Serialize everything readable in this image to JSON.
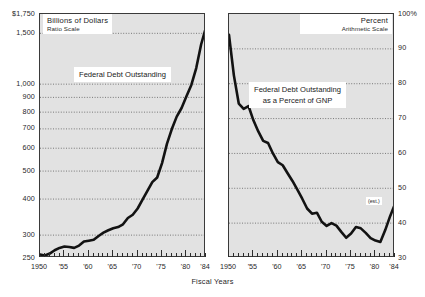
{
  "figure": {
    "axis_title": "Fiscal Years"
  },
  "chart_data": [
    {
      "id": "left",
      "type": "line",
      "title": "Federal Debt Outstanding",
      "header_line1": "Billions of Dollars",
      "header_line2": "Ratio Scale",
      "scale": "log",
      "xlabel": "Fiscal Years",
      "ylabel": "Billions of Dollars",
      "grid": true,
      "legend": "none",
      "ylim": [
        250,
        1750
      ],
      "xlim": [
        1950,
        1984
      ],
      "ytick_labels": [
        "$1,750",
        "1,500",
        "1,000",
        "900",
        "800",
        "700",
        "600",
        "500",
        "400",
        "300",
        "250"
      ],
      "ytick_values": [
        1750,
        1500,
        1000,
        900,
        800,
        700,
        600,
        500,
        400,
        300,
        250
      ],
      "gridline_values": [
        1500,
        1000,
        900,
        800,
        700,
        600,
        500,
        400,
        300
      ],
      "xtick_labels": [
        "1950",
        "'55",
        "'60",
        "'65",
        "'70",
        "'75",
        "'80",
        "'84"
      ],
      "xtick_values": [
        1950,
        1955,
        1960,
        1965,
        1970,
        1975,
        1980,
        1984
      ],
      "x": [
        1950,
        1951,
        1952,
        1953,
        1954,
        1955,
        1956,
        1957,
        1958,
        1959,
        1960,
        1961,
        1962,
        1963,
        1964,
        1965,
        1966,
        1967,
        1968,
        1969,
        1970,
        1971,
        1972,
        1973,
        1974,
        1975,
        1976,
        1977,
        1978,
        1979,
        1980,
        1981,
        1982,
        1983,
        1984
      ],
      "values": [
        257,
        255,
        259,
        266,
        271,
        274,
        273,
        271,
        276,
        285,
        287,
        289,
        298,
        306,
        312,
        317,
        320,
        327,
        344,
        353,
        371,
        398,
        427,
        458,
        475,
        533,
        621,
        699,
        772,
        827,
        908,
        994,
        1137,
        1372,
        1576
      ]
    },
    {
      "id": "right",
      "type": "line",
      "title": "Federal Debt Outstanding as a Percent of GNP",
      "title_line1": "Federal Debt Outstanding",
      "title_line2": "as a Percent of GNP",
      "header_line1": "Percent",
      "header_line2": "Arithmetic Scale",
      "scale": "linear",
      "xlabel": "Fiscal Years",
      "ylabel": "Percent",
      "grid": true,
      "legend": "none",
      "ylim": [
        30,
        100
      ],
      "xlim": [
        1950,
        1984
      ],
      "ytick_labels": [
        "100%",
        "90",
        "80",
        "70",
        "60",
        "50",
        "40",
        "30"
      ],
      "ytick_values": [
        100,
        90,
        80,
        70,
        60,
        50,
        40,
        30
      ],
      "gridline_values": [
        90,
        80,
        70,
        60,
        50,
        40
      ],
      "xtick_labels": [
        "1950",
        "'55",
        "'60",
        "'65",
        "'70",
        "'75",
        "'80",
        "'84"
      ],
      "xtick_values": [
        1950,
        1955,
        1960,
        1965,
        1970,
        1975,
        1980,
        1984
      ],
      "annotation": "(est.)",
      "annotation_x": 1983,
      "x": [
        1950,
        1951,
        1952,
        1953,
        1954,
        1955,
        1956,
        1957,
        1958,
        1959,
        1960,
        1961,
        1962,
        1963,
        1964,
        1965,
        1966,
        1967,
        1968,
        1969,
        1970,
        1971,
        1972,
        1973,
        1974,
        1975,
        1976,
        1977,
        1978,
        1979,
        1980,
        1981,
        1982,
        1983,
        1984
      ],
      "values": [
        94.0,
        82.4,
        74.3,
        72.8,
        73.6,
        69.5,
        66.3,
        63.6,
        63.0,
        60.0,
        57.5,
        56.6,
        54.3,
        52.1,
        49.6,
        47.0,
        44.2,
        42.7,
        43.0,
        40.4,
        39.2,
        40.0,
        39.3,
        37.5,
        35.8,
        37.0,
        38.9,
        38.5,
        37.2,
        35.7,
        35.0,
        34.6,
        38.0,
        42.0,
        45.5
      ]
    }
  ]
}
